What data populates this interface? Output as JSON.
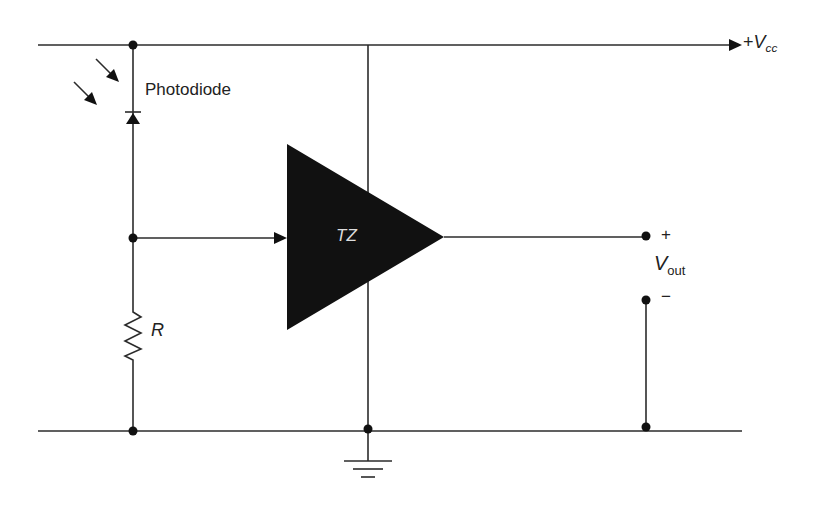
{
  "diagram": {
    "type": "circuit",
    "labels": {
      "photodiode": "Photodiode",
      "supply_sign": "+",
      "supply_main": "V",
      "supply_sub": "cc",
      "amplifier": "TZ",
      "resistor": "R",
      "vout_main": "V",
      "vout_sub": "out",
      "vout_plus": "+",
      "vout_minus": "−"
    },
    "components": [
      {
        "id": "photodiode",
        "kind": "photodiode",
        "label": "Photodiode"
      },
      {
        "id": "R",
        "kind": "resistor",
        "label": "R"
      },
      {
        "id": "TZ",
        "kind": "transimpedance-amplifier",
        "label": "TZ"
      },
      {
        "id": "vcc",
        "kind": "supply-rail",
        "label": "+Vcc"
      },
      {
        "id": "gnd",
        "kind": "ground"
      },
      {
        "id": "vout",
        "kind": "output-terminals",
        "label": "Vout"
      }
    ],
    "colors": {
      "line": "#2b2b2b",
      "fill": "#111111",
      "text": "#222222",
      "amp_text": "#dddddd"
    }
  }
}
